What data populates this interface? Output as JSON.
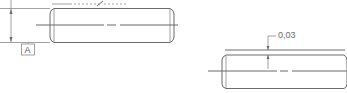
{
  "drawing": {
    "left_view": {
      "datum_label": "A",
      "description": "Cylindrical pin side view with height dimension and datum A"
    },
    "right_view": {
      "tolerance_label": "0,03",
      "description": "Cylindrical pin side view with 0,03 tolerance indication"
    }
  },
  "colors": {
    "line": "#6b6b6b",
    "background": "#ffffff"
  }
}
